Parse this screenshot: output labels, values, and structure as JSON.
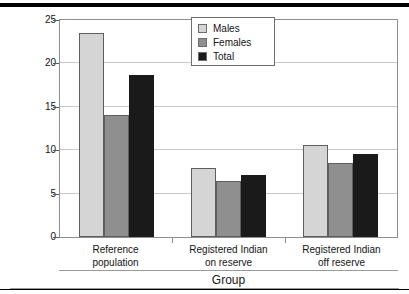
{
  "chart_data": {
    "type": "bar",
    "title": "",
    "subtitle": "",
    "xlabel": "Group",
    "ylabel": "Income ($000)",
    "categories": [
      "Reference\npopulation",
      "Registered Indian\non reserve",
      "Registered Indian\noff reserve"
    ],
    "category_lines": [
      [
        "Reference",
        "population"
      ],
      [
        "Registered Indian",
        "on reserve"
      ],
      [
        "Registered Indian",
        "off reserve"
      ]
    ],
    "series": [
      {
        "name": "Males",
        "color": "#d5d5d5",
        "values": [
          23.5,
          7.9,
          10.6
        ]
      },
      {
        "name": "Females",
        "color": "#8f8f8f",
        "values": [
          14.0,
          6.5,
          8.5
        ]
      },
      {
        "name": "Total",
        "color": "#1a1a1a",
        "values": [
          18.7,
          7.2,
          9.6
        ]
      }
    ],
    "ylim": [
      0,
      25
    ],
    "yticks": [
      0,
      5,
      10,
      15,
      20,
      25
    ],
    "ytick_labels": [
      "0",
      "5",
      "10",
      "15",
      "20",
      "25"
    ],
    "grid": true,
    "grid_axis": "y",
    "legend_position": "top-center",
    "legend_entries": [
      "Males",
      "Females",
      "Total"
    ]
  },
  "colors": {
    "males": "#d5d5d5",
    "females": "#8f8f8f",
    "total": "#1a1a1a",
    "gridline": "#c9c9c9",
    "frame": "#8e8e8e",
    "bar_outline": "#5e5e5e",
    "text": "#141414",
    "rule": "#000000"
  }
}
